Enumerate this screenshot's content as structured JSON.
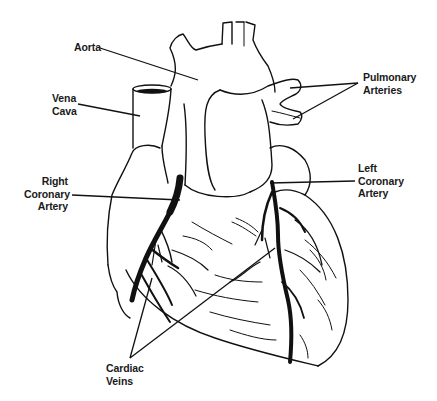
{
  "diagram": {
    "labels": {
      "aorta": [
        "Aorta"
      ],
      "vena_cava": [
        "Vena",
        "Cava"
      ],
      "pulmonary_arteries": [
        "Pulmonary",
        "Arteries"
      ],
      "right_coronary_artery": [
        "Right",
        "Coronary",
        "Artery"
      ],
      "left_coronary_artery": [
        "Left",
        "Coronary",
        "Artery"
      ],
      "cardiac_veins": [
        "Cardiac",
        "Veins"
      ]
    },
    "colors": {
      "line": "#111111",
      "background": "#ffffff",
      "text": "#1a1a1a"
    }
  }
}
